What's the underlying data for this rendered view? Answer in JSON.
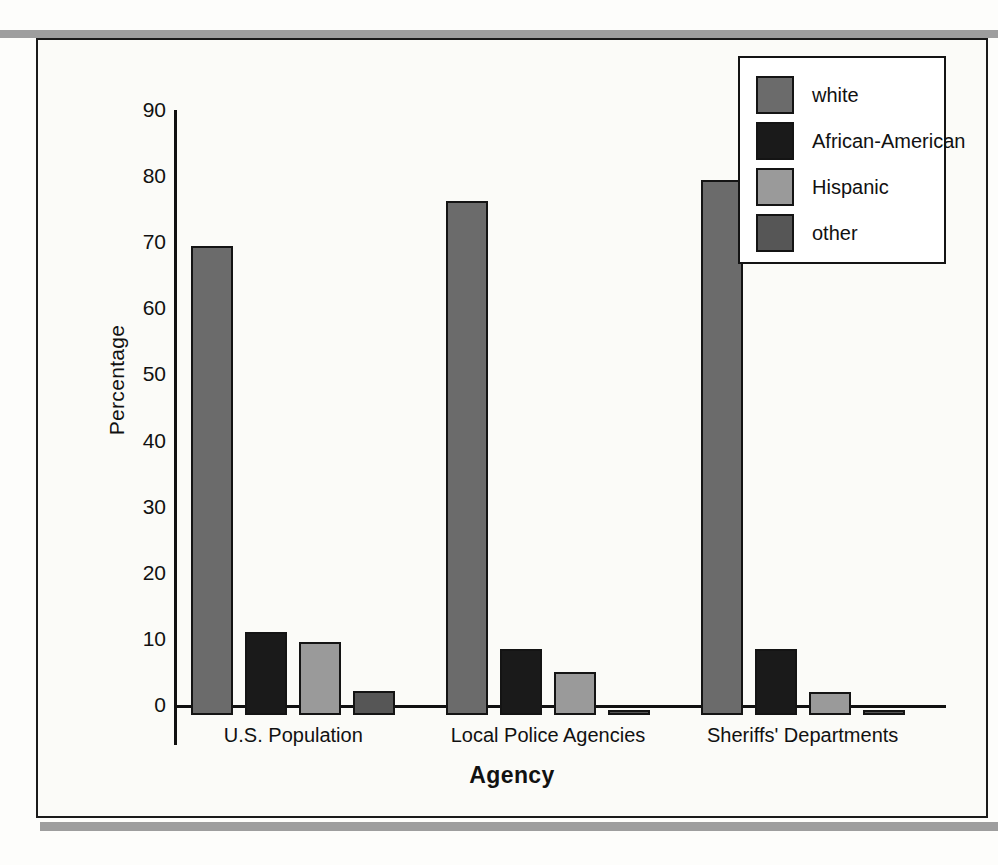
{
  "chart_data": {
    "type": "bar",
    "title": "",
    "xlabel": "Agency",
    "ylabel": "Percentage",
    "ylim": [
      0,
      90
    ],
    "yticks": [
      0,
      10,
      20,
      30,
      40,
      50,
      60,
      70,
      80,
      90
    ],
    "grid": false,
    "legend_position": "top-right",
    "categories": [
      "U.S. Population",
      "Local Police Agencies",
      "Sheriffs' Departments"
    ],
    "series": [
      {
        "name": "white",
        "color": "#6b6b6b",
        "values": [
          71.0,
          77.7,
          81.0
        ]
      },
      {
        "name": "African-American",
        "color": "#1a1a1a",
        "values": [
          12.5,
          10.0,
          10.0
        ]
      },
      {
        "name": "Hispanic",
        "color": "#9a9a9a",
        "values": [
          11.0,
          6.5,
          3.5
        ]
      },
      {
        "name": "other",
        "color": "#565656",
        "values": [
          3.7,
          0.8,
          0.4
        ]
      }
    ]
  },
  "colors": {
    "axis": "#111111",
    "frame": "#1b1b1b",
    "rule": "#9e9e9e",
    "background": "#fbfbf8",
    "legend_background": "#ffffff"
  }
}
